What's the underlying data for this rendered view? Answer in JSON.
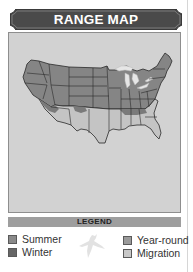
{
  "header": {
    "title": "RANGE MAP"
  },
  "map": {
    "region": "Contiguous United States",
    "background_color": "#d2d2d2",
    "colors": {
      "summer": "#8a8a8a",
      "winter": "#6a6a6a",
      "year_round": "#7d7d7d",
      "migration": "#c4c4c4",
      "state_border": "#2a2a2a",
      "great_lakes": "#e8e8e8"
    }
  },
  "legend": {
    "title": "LEGEND",
    "items": [
      {
        "label": "Summer",
        "color": "#8a8a8a"
      },
      {
        "label": "Winter",
        "color": "#666666"
      },
      {
        "label": "Year-round",
        "color": "#9a9a9a"
      },
      {
        "label": "Migration",
        "color": "#c8c8c8"
      }
    ],
    "icon": "bird-silhouette-icon"
  }
}
